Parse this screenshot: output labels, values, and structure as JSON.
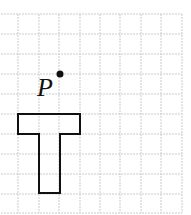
{
  "diagram": {
    "type": "grid-figure",
    "grid": {
      "x0": -2,
      "y0": 14,
      "cell": 20.1,
      "cols": 9,
      "rows": 10,
      "line_color": "#c8c8c8"
    },
    "point": {
      "label": "P",
      "cx": 60,
      "cy": 74,
      "r": 3.5
    },
    "shape": {
      "name": "T",
      "stroke": "#111111"
    }
  }
}
